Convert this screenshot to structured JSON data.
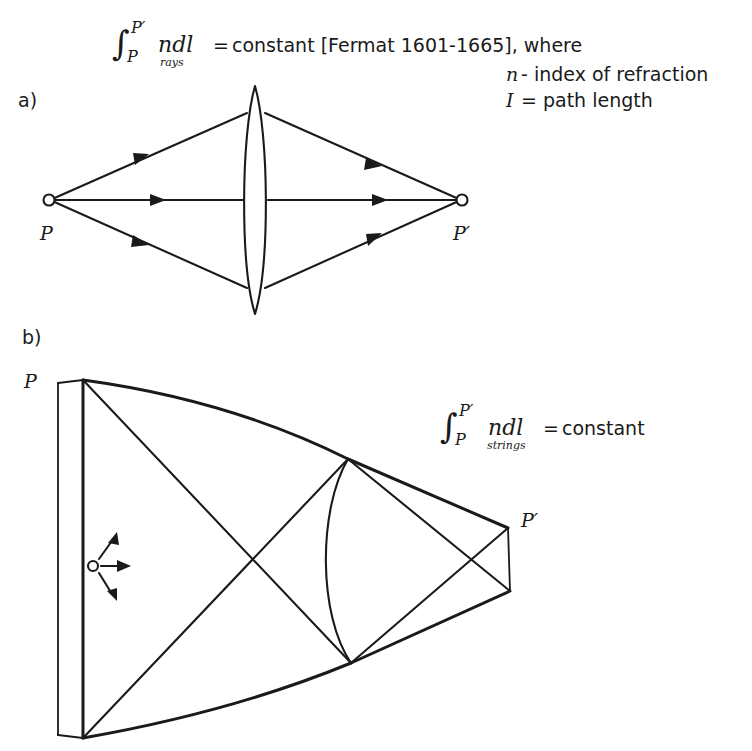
{
  "figure": {
    "background_color": "#ffffff",
    "ink_color": "#1a1a1a",
    "width": 752,
    "height": 751
  },
  "formula_rays": {
    "integral_sign": "∫",
    "upper_limit": "P′",
    "lower_limit": "P",
    "integrand": "ndl",
    "subscript": "rays",
    "equals": "=",
    "right_side": "constant [Fermat 1601-1665], where"
  },
  "legend": {
    "line1_symbol": "n",
    "line1_text": "- index of refraction",
    "line2_symbol": "I",
    "line2_text": "= path length"
  },
  "panel_a": {
    "label": "a)",
    "source_label": "P",
    "image_label": "P′",
    "element": "biconvex-lens",
    "ray_count": 3
  },
  "panel_b": {
    "label": "b)",
    "source_label": "P",
    "image_label": "P′",
    "element": "string-network",
    "bead_marker": "open-circle"
  },
  "formula_strings": {
    "integral_sign": "∫",
    "upper_limit": "P′",
    "lower_limit": "P",
    "integrand": "ndl",
    "subscript": "strings",
    "equals": "=",
    "right_side": "constant"
  }
}
